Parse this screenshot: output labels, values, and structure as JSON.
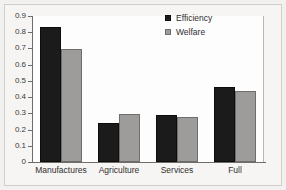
{
  "chart_data": {
    "type": "bar",
    "title": "",
    "subtitle": "",
    "xlabel": "",
    "ylabel": "",
    "ylim": [
      0,
      0.9
    ],
    "yticks": [
      "0",
      "0.1",
      "0.2",
      "0.3",
      "0.4",
      "0.5",
      "0.6",
      "0.7",
      "0.8",
      "0.9"
    ],
    "ytick_values": [
      0,
      0.1,
      0.2,
      0.3,
      0.4,
      0.5,
      0.6,
      0.7,
      0.8,
      0.9
    ],
    "grid": false,
    "legend_position": "top-right",
    "categories": [
      "Manufactures",
      "Agriculture",
      "Services",
      "Full"
    ],
    "series": [
      {
        "name": "Efficiency",
        "color": "#1b1b1b",
        "values": [
          0.83,
          0.24,
          0.29,
          0.46
        ]
      },
      {
        "name": "Welfare",
        "color": "#9d9c9b",
        "values": [
          0.695,
          0.295,
          0.28,
          0.435
        ]
      }
    ]
  },
  "legend": {
    "items": [
      {
        "label": "Efficiency",
        "swatch": "legend-swatch-efficiency"
      },
      {
        "label": "Welfare",
        "swatch": "legend-swatch-welfare"
      }
    ]
  },
  "colors": {
    "efficiency": "#1b1b1b",
    "welfare": "#9d9c9b",
    "axis": "#6e6d6c",
    "frame": "#cfcecd",
    "background": "#f6f5f4",
    "plot_background": "#fdfdfd"
  }
}
